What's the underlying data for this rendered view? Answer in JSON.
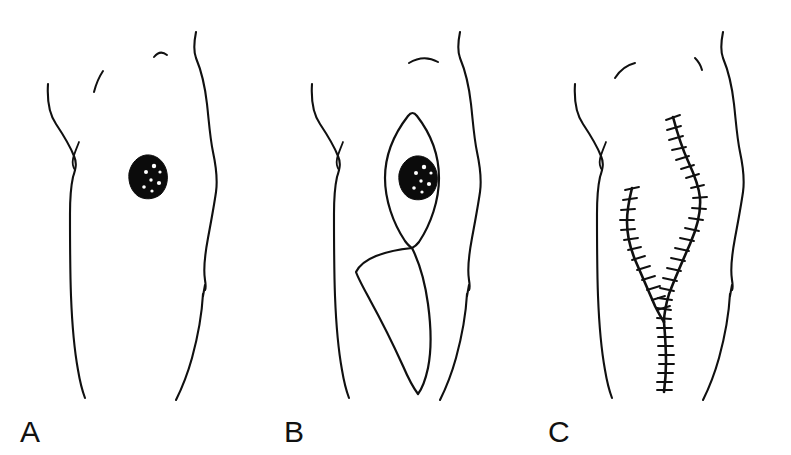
{
  "figure": {
    "background_color": "#ffffff",
    "ink_color": "#101010",
    "lesion_color": "#0b0b0b",
    "speckle_color": "#ffffff",
    "panel_count": 3
  },
  "panels": [
    {
      "id": "a",
      "label": "A",
      "caption": "Pigmented lesion on the trunk",
      "stage": "pre-operative",
      "features": [
        "torso-outline",
        "lesion"
      ],
      "lesion": {
        "name": "pigmented-lesion",
        "shape": "irregular rounded",
        "fill": "#0b0b0b",
        "speckles": 7,
        "center_x": 147,
        "center_y": 176,
        "width_px": 34,
        "height_px": 42
      }
    },
    {
      "id": "b",
      "label": "B",
      "caption": "Planned elliptical excision outlines around the lesion",
      "stage": "excision-planning",
      "features": [
        "torso-outline",
        "lesion",
        "upper-ellipse",
        "lower-ellipse"
      ],
      "lesion": {
        "name": "pigmented-lesion",
        "shape": "irregular rounded",
        "fill": "#0b0b0b",
        "speckles": 7,
        "center_x": 417,
        "center_y": 177,
        "width_px": 34,
        "height_px": 42
      },
      "excisions": [
        {
          "name": "upper-ellipse",
          "orientation": "vertical",
          "apex_top_y": 116,
          "apex_bottom_y": 245
        },
        {
          "name": "lower-ellipse",
          "orientation": "vertical-oblique",
          "apex_top_y": 245,
          "apex_bottom_y": 390
        }
      ]
    },
    {
      "id": "c",
      "label": "C",
      "caption": "Y-shaped sutured closure after excision",
      "stage": "post-operative",
      "features": [
        "torso-outline",
        "suture-line-right",
        "suture-line-left",
        "suture-line-tail"
      ],
      "closure": {
        "name": "y-shaped-closure",
        "shape": "Y",
        "segments": 3,
        "suture_ticks_total": 62,
        "junction_x": 664,
        "junction_y": 322
      }
    }
  ],
  "labels": {
    "a": "A",
    "b": "B",
    "c": "C"
  }
}
